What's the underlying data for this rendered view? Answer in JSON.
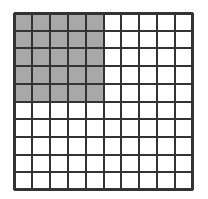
{
  "figure": {
    "kind": "shaded-area-grid",
    "background_color": "#ffffff"
  },
  "grid": {
    "columns": 10,
    "rows": 10,
    "total_cells": 100,
    "origin_x": 14,
    "origin_y": 13,
    "width": 179,
    "height": 177,
    "cell_width": 17.9,
    "cell_height": 17.7,
    "line_color": "#333333",
    "line_width": 2,
    "outer_border_color": "#333333",
    "outer_border_width": 2
  },
  "shaded_region": {
    "fill_color": "#a8a8a8",
    "start_column": 0,
    "start_row": 0,
    "columns": 5,
    "rows": 5,
    "cell_count": 25,
    "fraction_label": "25/100",
    "percent_label": "25%"
  },
  "unshaded_region": {
    "fill_color": "#ffffff",
    "cell_count": 75,
    "fraction_label": "75/100",
    "percent_label": "75%"
  },
  "chart_data": {
    "type": "heatmap",
    "title": "",
    "subtitle": "",
    "xlabel": "",
    "ylabel": "",
    "grid": true,
    "legend": false,
    "categories_x": [
      "1",
      "2",
      "3",
      "4",
      "5",
      "6",
      "7",
      "8",
      "9",
      "10"
    ],
    "categories_y": [
      "1",
      "2",
      "3",
      "4",
      "5",
      "6",
      "7",
      "8",
      "9",
      "10"
    ],
    "xlim": [
      0,
      10
    ],
    "ylim": [
      0,
      10
    ],
    "value_colors": {
      "0": "#ffffff",
      "1": "#a8a8a8"
    },
    "values": [
      [
        1,
        1,
        1,
        1,
        1,
        0,
        0,
        0,
        0,
        0
      ],
      [
        1,
        1,
        1,
        1,
        1,
        0,
        0,
        0,
        0,
        0
      ],
      [
        1,
        1,
        1,
        1,
        1,
        0,
        0,
        0,
        0,
        0
      ],
      [
        1,
        1,
        1,
        1,
        1,
        0,
        0,
        0,
        0,
        0
      ],
      [
        1,
        1,
        1,
        1,
        1,
        0,
        0,
        0,
        0,
        0
      ],
      [
        0,
        0,
        0,
        0,
        0,
        0,
        0,
        0,
        0,
        0
      ],
      [
        0,
        0,
        0,
        0,
        0,
        0,
        0,
        0,
        0,
        0
      ],
      [
        0,
        0,
        0,
        0,
        0,
        0,
        0,
        0,
        0,
        0
      ],
      [
        0,
        0,
        0,
        0,
        0,
        0,
        0,
        0,
        0,
        0
      ],
      [
        0,
        0,
        0,
        0,
        0,
        0,
        0,
        0,
        0,
        0
      ]
    ],
    "shaded_count": 25,
    "unshaded_count": 75,
    "total_count": 100
  }
}
